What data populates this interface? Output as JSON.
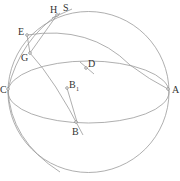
{
  "diagram": {
    "type": "sphere-geometry",
    "colors": {
      "line": "#9a9a9a",
      "text": "#333333",
      "background": "#ffffff"
    },
    "labels": {
      "H": "H",
      "S": "S",
      "E": "E",
      "G": "G",
      "D": "D",
      "C": "C",
      "A": "A",
      "B1_main": "B",
      "B1_sub": "1",
      "B": "B"
    },
    "points": [
      {
        "name": "H",
        "x": 57,
        "y": 15
      },
      {
        "name": "E",
        "x": 27,
        "y": 35
      },
      {
        "name": "G",
        "x": 30,
        "y": 53
      },
      {
        "name": "D",
        "x": 86,
        "y": 68
      },
      {
        "name": "C",
        "x": 8,
        "y": 89
      },
      {
        "name": "A",
        "x": 168,
        "y": 89
      },
      {
        "name": "B1",
        "x": 67,
        "y": 88
      },
      {
        "name": "B",
        "x": 76,
        "y": 122
      }
    ]
  }
}
